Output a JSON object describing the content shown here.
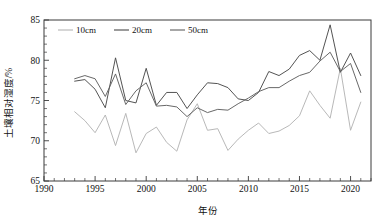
{
  "chart_data": {
    "type": "line",
    "title": "",
    "xlabel": "年份",
    "ylabel": "土壤相对湿度/%",
    "xlim": [
      1990,
      2022
    ],
    "ylim": [
      65,
      85
    ],
    "xticks": [
      1990,
      1995,
      2000,
      2005,
      2010,
      2015,
      2020
    ],
    "xticklabels": [
      "1990",
      "1995",
      "2000",
      "2005",
      "2010",
      "2015",
      "2020"
    ],
    "yticks": [
      65,
      70,
      75,
      80,
      85
    ],
    "yticklabels": [
      "65",
      "70",
      "75",
      "80",
      "85"
    ],
    "xminor_step": 1,
    "yminor_step": 1,
    "grid": false,
    "legend_position": "top-left-inside",
    "x": [
      1993,
      1994,
      1995,
      1996,
      1997,
      1998,
      1999,
      2000,
      2001,
      2002,
      2003,
      2004,
      2005,
      2006,
      2007,
      2008,
      2009,
      2010,
      2011,
      2012,
      2013,
      2014,
      2015,
      2016,
      2017,
      2018,
      2019,
      2020,
      2021
    ],
    "series": [
      {
        "name": "10cm",
        "color": "#b4b4b4",
        "values": [
          73.6,
          72.5,
          71.0,
          73.2,
          69.4,
          73.4,
          68.5,
          70.9,
          71.7,
          69.8,
          68.7,
          72.6,
          74.6,
          71.3,
          71.5,
          68.8,
          70.2,
          71.3,
          72.2,
          70.9,
          71.2,
          71.9,
          73.1,
          76.2,
          74.4,
          72.8,
          79.0,
          71.3,
          74.8
        ]
      },
      {
        "name": "20cm",
        "color": "#4a4a4a",
        "values": [
          77.4,
          77.6,
          76.4,
          74.1,
          80.3,
          75.0,
          74.7,
          79.0,
          74.4,
          76.0,
          76.0,
          74.0,
          75.7,
          77.2,
          77.1,
          76.6,
          75.2,
          75.0,
          76.0,
          78.6,
          78.1,
          78.9,
          80.6,
          81.2,
          80.0,
          84.4,
          78.5,
          80.9,
          78.1
        ]
      },
      {
        "name": "50cm",
        "color": "#606060",
        "values": [
          77.7,
          78.1,
          77.7,
          75.5,
          78.3,
          74.5,
          76.2,
          77.2,
          74.3,
          74.4,
          74.2,
          73.0,
          74.1,
          73.5,
          73.9,
          73.8,
          74.6,
          75.3,
          76.1,
          76.6,
          76.6,
          77.4,
          78.1,
          78.5,
          79.9,
          81.0,
          78.6,
          79.6,
          76.0
        ]
      }
    ]
  },
  "legend": {
    "items": [
      {
        "label": "10cm"
      },
      {
        "label": "20cm"
      },
      {
        "label": "50cm"
      }
    ]
  },
  "top_fragment": ""
}
